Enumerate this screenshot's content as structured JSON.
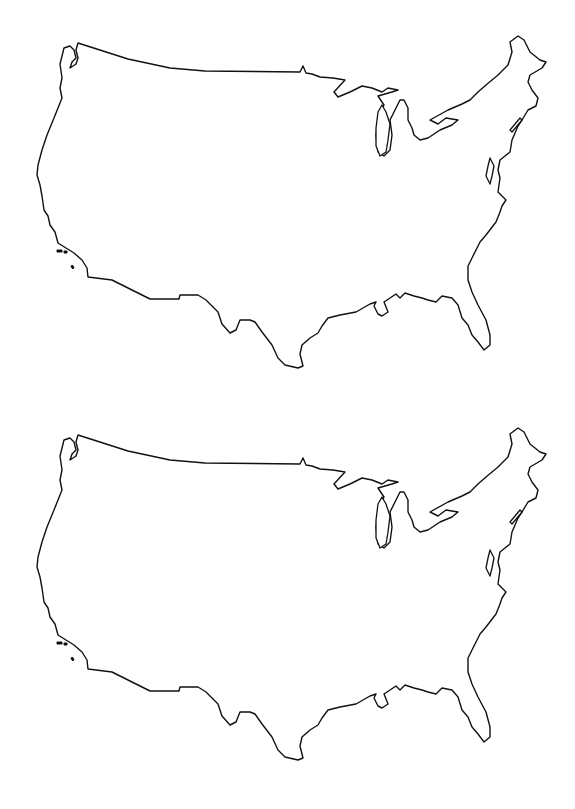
{
  "page": {
    "title": "Blank outline maps of the contiguous United States",
    "background": "#ffffff",
    "line_color": "#111111"
  },
  "maps": [
    {
      "label": "United States outline map (top)",
      "offset_y": 0
    },
    {
      "label": "United States outline map (bottom)",
      "offset_y": 392
    }
  ]
}
